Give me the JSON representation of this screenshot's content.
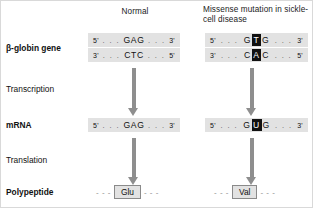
{
  "figure": {
    "columns": [
      {
        "id": "normal",
        "header": "Normal"
      },
      {
        "id": "mutant",
        "header": "Missense mutation in sickle-cell disease"
      }
    ],
    "row_labels": {
      "gene": "β-globin gene",
      "transcription": "Transcription",
      "mrna": "mRNA",
      "translation": "Translation",
      "polypeptide": "Polypeptide"
    },
    "normal": {
      "dna_template_strand": {
        "five_prime": "5'",
        "three_prime": "3'",
        "left_dots": ". . .",
        "right_dots": ". . .",
        "bases": "GAG"
      },
      "dna_coding_strand": {
        "five_prime": "5'",
        "three_prime": "3'",
        "left_dots": ". . .",
        "right_dots": ". . .",
        "bases": "CTC"
      },
      "mrna": {
        "five_prime": "5'",
        "three_prime": "3'",
        "left_dots": ". . .",
        "right_dots": ". . .",
        "bases": "GAG"
      },
      "amino_acid": "Glu",
      "left_dash": "- - -",
      "right_dash": "- - -"
    },
    "mutant": {
      "dna_template_strand": {
        "five_prime": "5'",
        "three_prime": "3'",
        "left_dots": ". . .",
        "right_dots": ". . .",
        "base_left": "G",
        "base_highlighted": "T",
        "base_right": "G"
      },
      "dna_coding_strand": {
        "five_prime": "5'",
        "three_prime": "3'",
        "left_dots": ". . .",
        "right_dots": ". . .",
        "base_left": "C",
        "base_highlighted": "A",
        "base_right": "C"
      },
      "mrna": {
        "five_prime": "5'",
        "three_prime": "3'",
        "left_dots": ". . .",
        "right_dots": ". . .",
        "base_left": "G",
        "base_highlighted": "U",
        "base_right": "G"
      },
      "amino_acid": "Val",
      "left_dash": "- - -",
      "right_dash": "- - -"
    },
    "colors": {
      "band_background": "#e2e2e2",
      "highlight_background": "#111111",
      "highlight_text": "#ffffff",
      "arrow": "#8e8e8e",
      "text": "#1a1a1a",
      "page_background": "#ffffff"
    }
  }
}
